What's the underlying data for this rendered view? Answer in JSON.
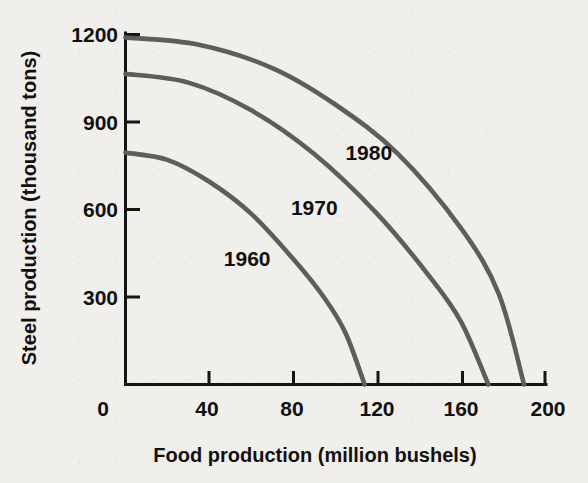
{
  "chart_data": {
    "type": "line",
    "title": "",
    "xlabel": "Food production (million bushels)",
    "ylabel": "Steel production (thousand tons)",
    "xlim": [
      0,
      200
    ],
    "ylim": [
      0,
      1200
    ],
    "xticks": [
      0,
      40,
      80,
      120,
      160,
      200
    ],
    "xtick_labels": [
      "0",
      "40",
      "80",
      "120",
      "160",
      "200"
    ],
    "yticks": [
      300,
      600,
      900,
      1200
    ],
    "ytick_labels": [
      "300",
      "600",
      "900",
      "1200"
    ],
    "grid": false,
    "legend_position": "inline-annotations",
    "curve_color": "#5d5d5d",
    "axis_color": "#151515",
    "background_color": "#f1efeb",
    "series": [
      {
        "name": "1960",
        "label": "1960",
        "label_x": 58,
        "label_y": 430,
        "y_intercept": 795,
        "x_intercept": 114,
        "x": [
          0,
          20,
          40,
          60,
          80,
          95,
          105,
          114
        ],
        "values": [
          795,
          770,
          695,
          585,
          430,
          295,
          175,
          0
        ]
      },
      {
        "name": "1970",
        "label": "1970",
        "label_x": 90,
        "label_y": 605,
        "y_intercept": 1065,
        "x_intercept": 173,
        "x": [
          0,
          30,
          60,
          90,
          120,
          145,
          160,
          173
        ],
        "values": [
          1065,
          1035,
          940,
          790,
          585,
          370,
          215,
          0
        ]
      },
      {
        "name": "1980",
        "label": "1980",
        "label_x": 116,
        "label_y": 795,
        "y_intercept": 1190,
        "x_intercept": 190,
        "x": [
          0,
          35,
          70,
          100,
          130,
          160,
          178,
          190
        ],
        "values": [
          1190,
          1165,
          1085,
          960,
          790,
          535,
          310,
          0
        ]
      }
    ]
  },
  "axes": {
    "x_title": "Food production (million bushels)",
    "y_title": "Steel production (thousand tons)"
  }
}
